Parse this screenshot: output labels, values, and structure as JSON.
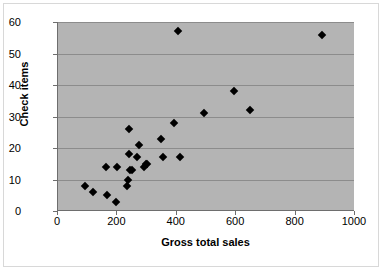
{
  "chart_data": {
    "type": "scatter",
    "title": "",
    "xlabel": "Gross total sales",
    "ylabel": "Check items",
    "xlim": [
      0,
      1000
    ],
    "ylim": [
      0,
      60
    ],
    "xticks": [
      0,
      200,
      400,
      600,
      800,
      1000
    ],
    "yticks": [
      0,
      10,
      20,
      30,
      40,
      50,
      60
    ],
    "grid": "horizontal",
    "legend": "none",
    "marker": "diamond",
    "marker_color": "#000000",
    "plot_background": "#b4b4b4",
    "points": [
      {
        "x": 90,
        "y": 8
      },
      {
        "x": 118,
        "y": 6
      },
      {
        "x": 160,
        "y": 14
      },
      {
        "x": 165,
        "y": 5
      },
      {
        "x": 195,
        "y": 3
      },
      {
        "x": 200,
        "y": 14
      },
      {
        "x": 232,
        "y": 8
      },
      {
        "x": 236,
        "y": 10
      },
      {
        "x": 238,
        "y": 18
      },
      {
        "x": 240,
        "y": 26
      },
      {
        "x": 243,
        "y": 13
      },
      {
        "x": 250,
        "y": 13
      },
      {
        "x": 265,
        "y": 17
      },
      {
        "x": 272,
        "y": 21
      },
      {
        "x": 288,
        "y": 14
      },
      {
        "x": 296,
        "y": 15
      },
      {
        "x": 300,
        "y": 15
      },
      {
        "x": 348,
        "y": 23
      },
      {
        "x": 352,
        "y": 17
      },
      {
        "x": 392,
        "y": 28
      },
      {
        "x": 404,
        "y": 57
      },
      {
        "x": 412,
        "y": 17
      },
      {
        "x": 490,
        "y": 31
      },
      {
        "x": 594,
        "y": 38
      },
      {
        "x": 648,
        "y": 32
      },
      {
        "x": 890,
        "y": 56
      }
    ]
  }
}
